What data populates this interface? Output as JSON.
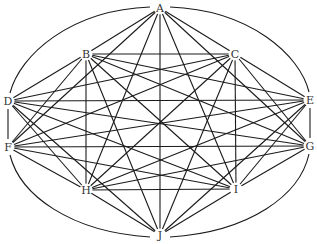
{
  "graph": {
    "type": "complete-graph",
    "nodes": [
      {
        "id": "A",
        "label": "A",
        "x": 160,
        "y": 8
      },
      {
        "id": "B",
        "label": "B",
        "x": 86,
        "y": 54
      },
      {
        "id": "C",
        "label": "C",
        "x": 235,
        "y": 54
      },
      {
        "id": "D",
        "label": "D",
        "x": 8,
        "y": 101
      },
      {
        "id": "E",
        "label": "E",
        "x": 310,
        "y": 100
      },
      {
        "id": "F",
        "label": "F",
        "x": 8,
        "y": 147
      },
      {
        "id": "G",
        "label": "G",
        "x": 310,
        "y": 146
      },
      {
        "id": "H",
        "label": "H",
        "x": 86,
        "y": 190
      },
      {
        "id": "I",
        "label": "I",
        "x": 236,
        "y": 189
      },
      {
        "id": "J",
        "label": "J",
        "x": 160,
        "y": 235
      }
    ],
    "curved_edges": [
      {
        "from": "A",
        "to": "D",
        "path": "M150,7 C70,10 20,55 10,93"
      },
      {
        "from": "A",
        "to": "E",
        "path": "M170,7 C250,10 300,55 309,92"
      },
      {
        "from": "D",
        "to": "F",
        "path": "M8,109 L8,139"
      },
      {
        "from": "E",
        "to": "G",
        "path": "M310,108 L310,138"
      },
      {
        "from": "F",
        "to": "J",
        "path": "M10,155 C20,195 70,232 150,237"
      },
      {
        "from": "G",
        "to": "J",
        "path": "M309,154 C300,195 250,232 170,237"
      }
    ],
    "edge_color": "#1a1a1a",
    "label_color": "#333333"
  }
}
